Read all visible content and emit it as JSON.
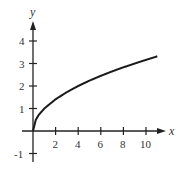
{
  "chart_data": {
    "type": "line",
    "title": "",
    "xlabel": "x",
    "ylabel": "y",
    "function": "y = sqrt(x)",
    "x": [
      0,
      0.25,
      0.5,
      1,
      2,
      3,
      4,
      5,
      6,
      7,
      8,
      9,
      10,
      11
    ],
    "series": [
      {
        "name": "y = √x",
        "values": [
          0,
          0.5,
          0.71,
          1,
          1.41,
          1.73,
          2,
          2.24,
          2.45,
          2.65,
          2.83,
          3,
          3.16,
          3.32
        ]
      }
    ],
    "xticks": [
      "2",
      "4",
      "6",
      "8",
      "10"
    ],
    "yticks": [
      "4",
      "3",
      "2",
      "1",
      "-1"
    ],
    "xlim": [
      0,
      12
    ],
    "ylim": [
      -1,
      5
    ],
    "grid": false,
    "legend": "none",
    "line_color": "#1a1a1a"
  }
}
